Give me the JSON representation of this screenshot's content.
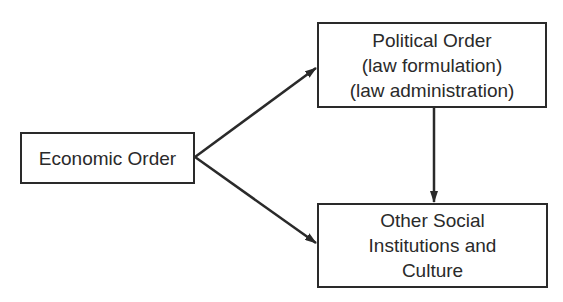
{
  "diagram": {
    "nodes": [
      {
        "id": "economic",
        "lines": [
          "Economic Order"
        ]
      },
      {
        "id": "political",
        "lines": [
          "Political Order",
          "(law formulation)",
          "(law administration)"
        ]
      },
      {
        "id": "social",
        "lines": [
          "Other Social",
          "Institutions and",
          "Culture"
        ]
      }
    ],
    "edges": [
      {
        "from": "economic",
        "to": "political"
      },
      {
        "from": "economic",
        "to": "social"
      },
      {
        "from": "political",
        "to": "social"
      }
    ]
  }
}
